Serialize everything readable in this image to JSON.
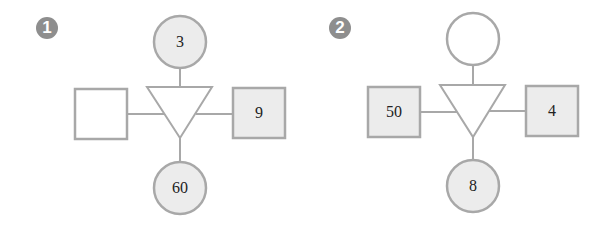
{
  "colors": {
    "stroke": "#a8a8a8",
    "filled": "#ececec",
    "empty": "#ffffff",
    "badge": "#8e8e8e",
    "text": "#222222"
  },
  "diagrams": [
    {
      "badge": "1",
      "top_circle": "3",
      "left_square": "",
      "right_square": "9",
      "bottom_circle": "60"
    },
    {
      "badge": "2",
      "top_circle": "",
      "left_square": "50",
      "right_square": "4",
      "bottom_circle": "8"
    }
  ]
}
